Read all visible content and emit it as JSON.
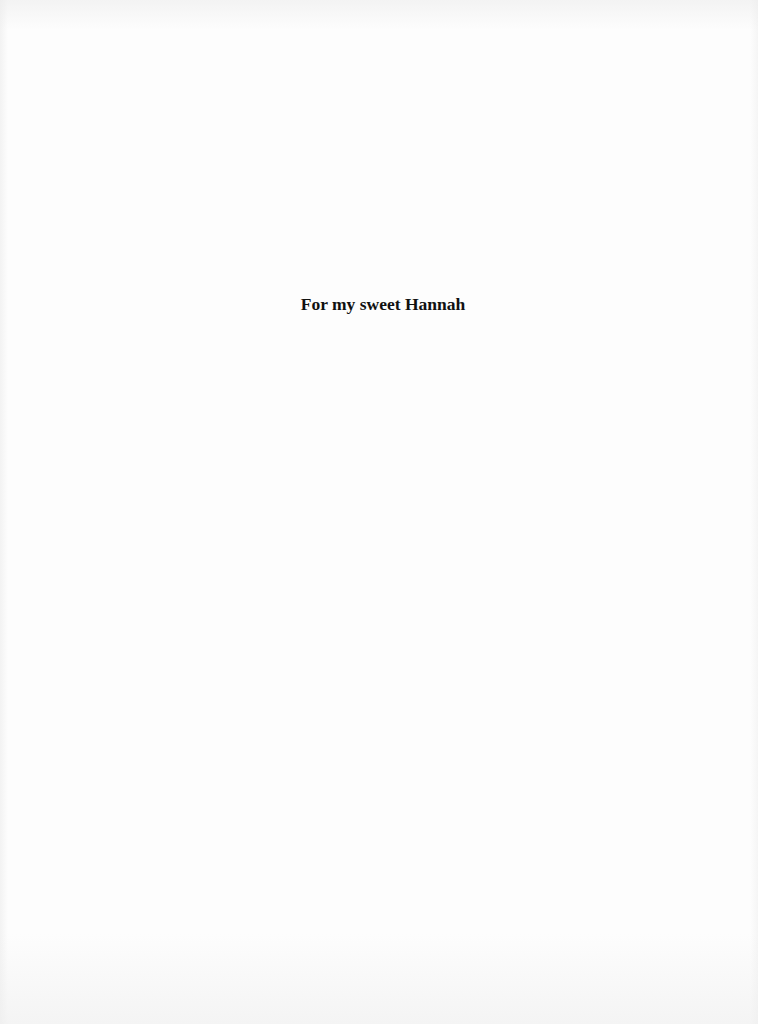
{
  "page": {
    "type": "dedication",
    "dedication_text": "For my sweet Hannah"
  },
  "colors": {
    "background": "#fdfdfd",
    "text": "#111111"
  }
}
